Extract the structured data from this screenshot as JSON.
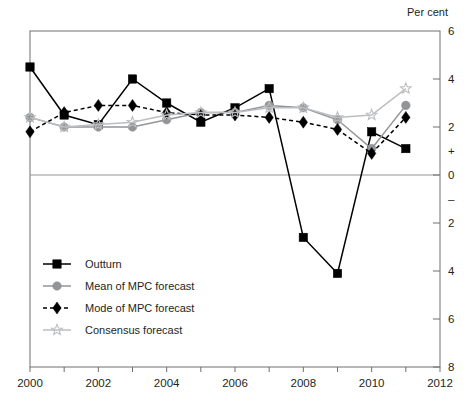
{
  "chart_data": {
    "type": "line",
    "title": "",
    "unit_label": "Per cent",
    "xlabel": "",
    "ylabel": "",
    "xlim": [
      2000,
      2012
    ],
    "ylim": [
      -8,
      6
    ],
    "x_ticks": [
      2000,
      2002,
      2004,
      2006,
      2008,
      2010,
      2012
    ],
    "x_tick_labels": [
      "2000",
      "2002",
      "2004",
      "2006",
      "2008",
      "2010",
      "2012"
    ],
    "x_minor_ticks": [
      2001,
      2003,
      2005,
      2007,
      2009,
      2011
    ],
    "y_ticks": [
      6,
      4,
      2,
      0,
      -2,
      -4,
      -6,
      -8
    ],
    "y_tick_labels": [
      "6",
      "4",
      "2",
      "0",
      "2",
      "4",
      "6",
      "8"
    ],
    "y_sign_markers": [
      {
        "value": 1.0,
        "label": "+"
      },
      {
        "value": -1.0,
        "label": "–"
      }
    ],
    "grid": false,
    "zero_line": true,
    "y_axis_side": "right",
    "legend_position": "lower-left",
    "series": [
      {
        "name": "Outturn",
        "marker": "square",
        "color": "#000000",
        "line_style": "solid",
        "x": [
          2000,
          2001,
          2002,
          2003,
          2004,
          2005,
          2006,
          2007,
          2008,
          2009,
          2010,
          2011
        ],
        "values": [
          4.5,
          2.5,
          2.1,
          4.0,
          3.0,
          2.2,
          2.8,
          3.6,
          -2.6,
          -4.1,
          1.8,
          1.1
        ]
      },
      {
        "name": "Mean of MPC forecast",
        "marker": "circle",
        "color": "#929497",
        "line_style": "solid",
        "x": [
          2000,
          2001,
          2002,
          2003,
          2004,
          2005,
          2006,
          2007,
          2008,
          2009,
          2010,
          2011
        ],
        "values": [
          2.4,
          2.0,
          2.0,
          2.0,
          2.3,
          2.6,
          2.6,
          2.9,
          2.8,
          2.3,
          1.1,
          2.9
        ]
      },
      {
        "name": "Mode of MPC forecast",
        "marker": "diamond",
        "color": "#000000",
        "line_style": "dashed",
        "x": [
          2000,
          2001,
          2002,
          2003,
          2004,
          2005,
          2006,
          2007,
          2008,
          2009,
          2010,
          2011
        ],
        "values": [
          1.8,
          2.6,
          2.9,
          2.9,
          2.6,
          2.5,
          2.5,
          2.4,
          2.2,
          1.9,
          0.9,
          2.4
        ]
      },
      {
        "name": "Consensus forecast",
        "marker": "star",
        "color": "#bcbec0",
        "line_style": "solid",
        "x": [
          2000,
          2001,
          2002,
          2003,
          2004,
          2005,
          2006,
          2007,
          2008,
          2009,
          2010,
          2011
        ],
        "values": [
          2.4,
          2.0,
          2.1,
          2.2,
          2.5,
          2.6,
          2.6,
          2.8,
          2.8,
          2.4,
          2.5,
          3.6
        ]
      }
    ],
    "legend_entries": [
      {
        "label": "Outturn",
        "marker": "square",
        "color": "#000000",
        "line_style": "solid"
      },
      {
        "label": "Mean of MPC forecast",
        "marker": "circle",
        "color": "#929497",
        "line_style": "solid"
      },
      {
        "label": "Mode of MPC forecast",
        "marker": "diamond",
        "color": "#000000",
        "line_style": "dashed"
      },
      {
        "label": "Consensus forecast",
        "marker": "star",
        "color": "#bcbec0",
        "line_style": "solid"
      }
    ]
  }
}
